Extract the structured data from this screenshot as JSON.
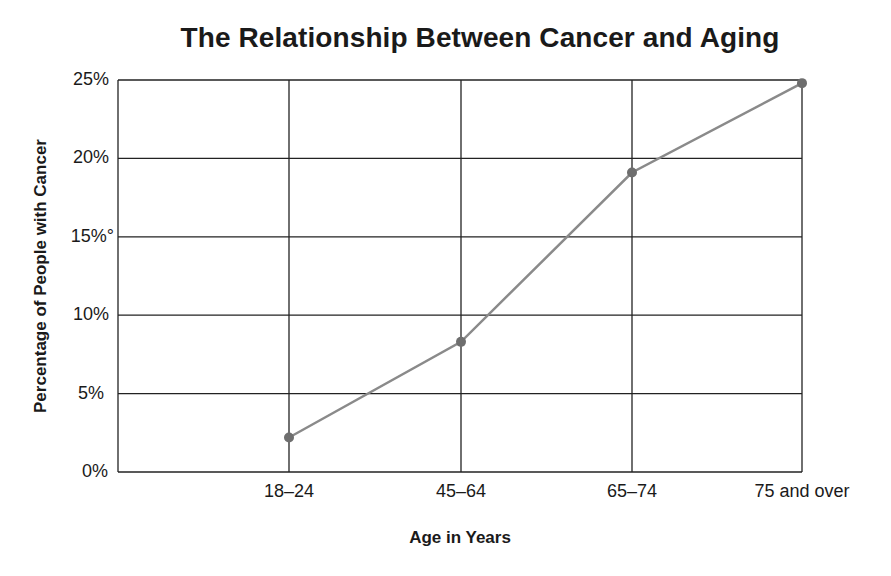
{
  "chart_data": {
    "type": "line",
    "title": "The Relationship Between Cancer and Aging",
    "xlabel": "Age in Years",
    "ylabel": "Percentage of People with Cancer",
    "categories": [
      "18–24",
      "45–64",
      "65–74",
      "75 and over"
    ],
    "series": [
      {
        "name": "Percentage of People with Cancer",
        "values": [
          2.2,
          8.3,
          19.1,
          24.8
        ],
        "color": "#8a8a8a"
      }
    ],
    "yticks": [
      "0%",
      "5%",
      "10%",
      "15%°",
      "20%",
      "25%"
    ],
    "ylim": [
      0,
      25
    ],
    "grid": true,
    "legend": "none"
  }
}
